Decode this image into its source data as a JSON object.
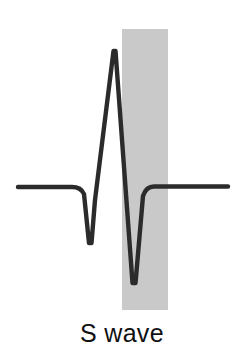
{
  "figure": {
    "name": "s-wave-ecg-waveform",
    "caption": "S wave",
    "background_color": "#ffffff",
    "trace_color": "#2b2b2b",
    "highlight_band_color": "#c9c9c9",
    "baseline_y": 187
  },
  "highlight_band": {
    "label": "S wave highlight band",
    "x": 122,
    "y": 29,
    "width": 46,
    "height": 281,
    "color": "#c9c9c9"
  },
  "chart_data": {
    "type": "line",
    "title": "S wave",
    "xlabel": "",
    "ylabel": "",
    "grid": false,
    "legend": "none",
    "xlim": [
      0,
      244
    ],
    "ylim": [
      356,
      0
    ],
    "annotations": [
      {
        "text": "S wave",
        "kind": "caption",
        "x": 114,
        "y": 338
      },
      {
        "text": "highlight band marking the S wave deflection",
        "kind": "shaded-region",
        "x_start": 122,
        "x_end": 168
      }
    ],
    "features": [
      {
        "name": "baseline-left",
        "x": 18,
        "y": 187
      },
      {
        "name": "q-wave-trough",
        "x": 90,
        "y": 245
      },
      {
        "name": "r-wave-peak",
        "x": 114,
        "y": 50
      },
      {
        "name": "s-wave-trough",
        "x": 134,
        "y": 284
      },
      {
        "name": "baseline-right",
        "x": 228,
        "y": 187
      }
    ],
    "series": [
      {
        "name": "ecg-trace",
        "x": [
          18,
          70,
          80,
          84,
          87,
          90,
          93,
          97,
          103,
          110,
          114,
          118,
          123,
          128,
          131,
          134,
          137,
          140,
          143,
          146,
          150,
          158,
          180,
          228
        ],
        "y": [
          187,
          187,
          188,
          193,
          215,
          245,
          220,
          190,
          140,
          70,
          50,
          78,
          150,
          230,
          265,
          284,
          262,
          225,
          200,
          189,
          186,
          185,
          186,
          187
        ]
      }
    ]
  }
}
